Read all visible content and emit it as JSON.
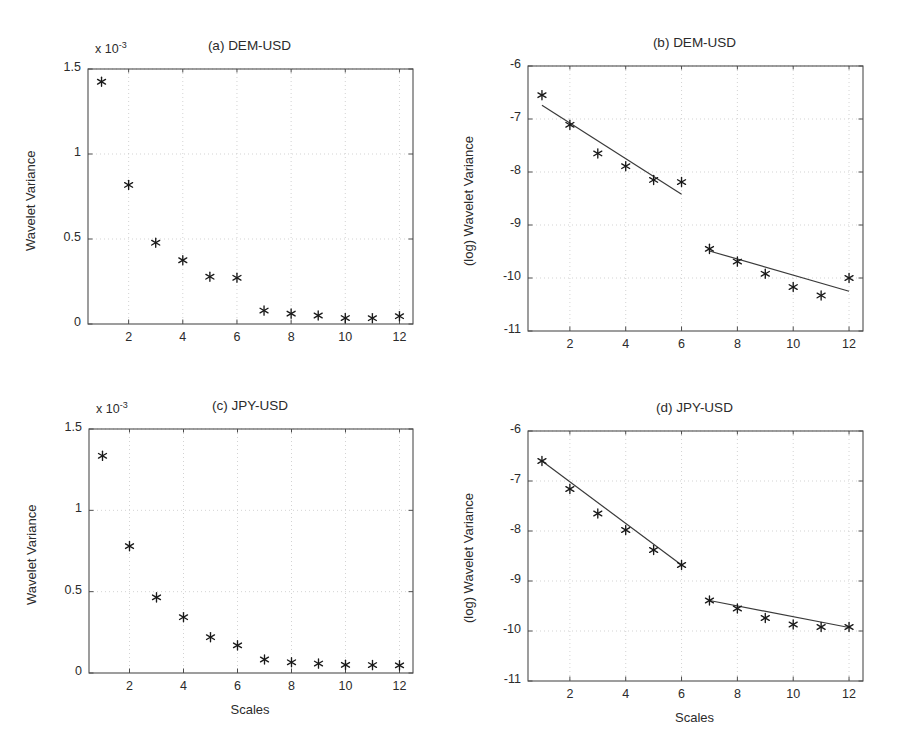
{
  "figure": {
    "background": "#ffffff",
    "axis_color": "#4d4d4d",
    "grid_color": "#c8c8c8",
    "marker_color": "#1a1a1a",
    "line_color": "#3a3a3a"
  },
  "labels": {
    "xlabel": "Scales",
    "ylabel_linear": "Wavelet Variance",
    "ylabel_log": "(log) Wavelet Variance",
    "exponent_prefix": "x 10",
    "exponent_power": "-3"
  },
  "chart_data": [
    {
      "id": "panel-a",
      "type": "scatter",
      "title": "(a) DEM-USD",
      "xlabel": "",
      "ylabel": "Wavelet Variance",
      "y_exponent": -3,
      "xlim": [
        0.5,
        12.5
      ],
      "ylim": [
        0,
        0.0015
      ],
      "xticks": [
        2,
        4,
        6,
        8,
        10,
        12
      ],
      "yticks": [
        0,
        0.0005,
        0.001,
        0.0015
      ],
      "ytick_labels": [
        "0",
        "0.5",
        "1",
        "1.5"
      ],
      "grid": true,
      "x": [
        1,
        2,
        3,
        4,
        5,
        6,
        7,
        8,
        9,
        10,
        11,
        12
      ],
      "values": [
        0.001425,
        0.000818,
        0.000478,
        0.000375,
        0.000278,
        0.000272,
        7.9e-05,
        6.1e-05,
        5e-05,
        3.5e-05,
        3.4e-05,
        4.6e-05
      ],
      "fit_lines": []
    },
    {
      "id": "panel-b",
      "type": "scatter",
      "title": "(b) DEM-USD",
      "xlabel": "",
      "ylabel": "(log) Wavelet Variance",
      "xlim": [
        0.5,
        12.5
      ],
      "ylim": [
        -11,
        -6
      ],
      "xticks": [
        2,
        4,
        6,
        8,
        10,
        12
      ],
      "yticks": [
        -11,
        -10,
        -9,
        -8,
        -7,
        -6
      ],
      "ytick_labels": [
        "-11",
        "-10",
        "-9",
        "-8",
        "-7",
        "-6"
      ],
      "grid": true,
      "x": [
        1,
        2,
        3,
        4,
        5,
        6,
        7,
        8,
        9,
        10,
        11,
        12
      ],
      "values": [
        -6.55,
        -7.11,
        -7.65,
        -7.89,
        -8.15,
        -8.19,
        -9.45,
        -9.69,
        -9.92,
        -10.17,
        -10.33,
        -10.0
      ],
      "fit_lines": [
        {
          "name": "fit-scales-1-6",
          "x0": 1,
          "y0": -6.74,
          "x1": 6,
          "y1": -8.42
        },
        {
          "name": "fit-scales-7-12",
          "x0": 7,
          "y0": -9.49,
          "x1": 12,
          "y1": -10.25
        }
      ]
    },
    {
      "id": "panel-c",
      "type": "scatter",
      "title": "(c) JPY-USD",
      "xlabel": "Scales",
      "ylabel": "Wavelet Variance",
      "y_exponent": -3,
      "xlim": [
        0.5,
        12.5
      ],
      "ylim": [
        0,
        0.0015
      ],
      "xticks": [
        2,
        4,
        6,
        8,
        10,
        12
      ],
      "yticks": [
        0,
        0.0005,
        0.001,
        0.0015
      ],
      "ytick_labels": [
        "0",
        "0.5",
        "1",
        "1.5"
      ],
      "grid": true,
      "x": [
        1,
        2,
        3,
        4,
        5,
        6,
        7,
        8,
        9,
        10,
        11,
        12
      ],
      "values": [
        0.001335,
        0.00078,
        0.000465,
        0.000343,
        0.00022,
        0.00017,
        8.3e-05,
        6.6e-05,
        5.8e-05,
        5e-05,
        4.9e-05,
        4.7e-05
      ],
      "fit_lines": []
    },
    {
      "id": "panel-d",
      "type": "scatter",
      "title": "(d) JPY-USD",
      "xlabel": "Scales",
      "ylabel": "(log) Wavelet Variance",
      "xlim": [
        0.5,
        12.5
      ],
      "ylim": [
        -11,
        -6
      ],
      "xticks": [
        2,
        4,
        6,
        8,
        10,
        12
      ],
      "yticks": [
        -11,
        -10,
        -9,
        -8,
        -7,
        -6
      ],
      "ytick_labels": [
        "-11",
        "-10",
        "-9",
        "-8",
        "-7",
        "-6"
      ],
      "grid": true,
      "x": [
        1,
        2,
        3,
        4,
        5,
        6,
        7,
        8,
        9,
        10,
        11,
        12
      ],
      "values": [
        -6.6,
        -7.16,
        -7.65,
        -7.98,
        -8.38,
        -8.68,
        -9.39,
        -9.55,
        -9.74,
        -9.87,
        -9.92,
        -9.92
      ],
      "fit_lines": [
        {
          "name": "fit-scales-1-6",
          "x0": 1,
          "y0": -6.6,
          "x1": 6,
          "y1": -8.68
        },
        {
          "name": "fit-scales-7-12",
          "x0": 7,
          "y0": -9.39,
          "x1": 12,
          "y1": -9.93
        }
      ]
    }
  ],
  "panels": {
    "a": {
      "title": "(a) DEM-USD"
    },
    "b": {
      "title": "(b) DEM-USD"
    },
    "c": {
      "title": "(c) JPY-USD"
    },
    "d": {
      "title": "(d) JPY-USD"
    }
  }
}
